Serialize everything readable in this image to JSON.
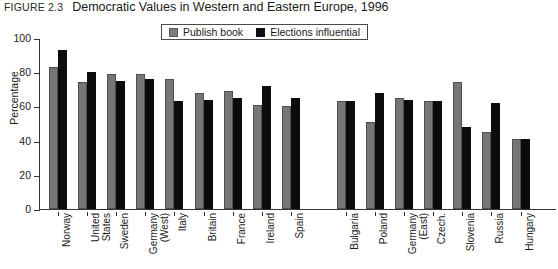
{
  "figure": {
    "label": "FIGURE 2.3",
    "title": "Democratic Values in Western and Eastern Europe, 1996"
  },
  "legend": {
    "position": "top-center",
    "items": [
      {
        "name": "Publish book",
        "color": "#767676"
      },
      {
        "name": "Elections influential",
        "color": "#0c0c0c"
      }
    ]
  },
  "chart_data": {
    "type": "bar",
    "title": "Democratic Values in Western and Eastern Europe, 1996",
    "xlabel": "",
    "ylabel": "Percentage",
    "ylim": [
      0,
      100
    ],
    "yticks": [
      0,
      20,
      40,
      60,
      80,
      100
    ],
    "grid": false,
    "legend_position": "top-center",
    "group_gap_after": "Spain",
    "categories": [
      "Norway",
      "United\nStates",
      "Sweden",
      "Germany\n(West)",
      "Italy",
      "Britain",
      "France",
      "Ireland",
      "Spain",
      "Bulgaria",
      "Poland",
      "Germany\n(East)",
      "Czech.",
      "Slovenia",
      "Russia",
      "Hungary"
    ],
    "series": [
      {
        "name": "Publish book",
        "color": "#767676",
        "values": [
          83,
          74,
          79,
          79,
          76,
          68,
          69,
          61,
          60,
          63,
          51,
          65,
          63,
          74,
          45,
          41
        ]
      },
      {
        "name": "Elections influential",
        "color": "#0c0c0c",
        "values": [
          93,
          80,
          75,
          76,
          63,
          64,
          65,
          72,
          65,
          63,
          68,
          64,
          63,
          48,
          62,
          41
        ]
      }
    ]
  }
}
